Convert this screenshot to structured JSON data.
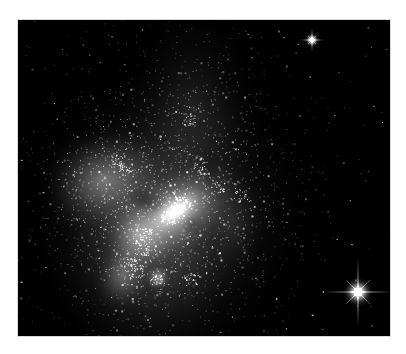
{
  "image": {
    "subject": "irregular galaxy with star-forming regions and foreground stars",
    "alt_text": "Grayscale telescope image of an irregular galaxy glowing against black space, with two bright foreground stars showing diffraction spikes on the right side",
    "palette": {
      "border": "#ffffff",
      "space": "#000000",
      "glow": "#e6e6e6",
      "star": "#ffffff"
    },
    "features": [
      {
        "name": "left-lobe",
        "kind": "galaxy-lobe"
      },
      {
        "name": "central-core",
        "kind": "galaxy-core"
      },
      {
        "name": "lower-knot",
        "kind": "star-forming-region"
      },
      {
        "name": "upper-plume",
        "kind": "faint-extension"
      },
      {
        "name": "top-right-star",
        "kind": "foreground-star-with-spikes"
      },
      {
        "name": "bottom-right-star",
        "kind": "foreground-star-with-spikes"
      }
    ]
  }
}
